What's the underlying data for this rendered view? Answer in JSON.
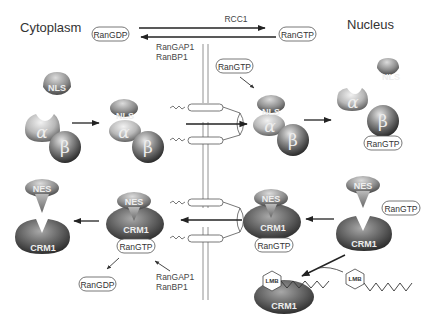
{
  "regions": {
    "cytoplasm": "Cytoplasm",
    "nucleus": "Nucleus"
  },
  "ran_cycle": {
    "ran_gdp_top": "RanGDP",
    "ran_gtp_top": "RanGTP",
    "rcc1": "RCC1",
    "rangap1_top": "RanGAP1",
    "ranbp1_top": "RanBP1"
  },
  "import_pathway": {
    "nls_cargo_left": "NLS",
    "alpha_left": "α",
    "beta_left": "β",
    "complex_nls": "NLS",
    "complex_alpha": "α",
    "complex_beta": "β",
    "ran_gtp_entering": "RanGTP",
    "pore_complex_nls": "NLS",
    "pore_complex_alpha": "α",
    "pore_complex_beta": "β",
    "nls_cargo_right": "NLS",
    "alpha_right": "α",
    "beta_right": "β",
    "ran_gtp_beta": "RanGTP"
  },
  "export_pathway": {
    "nes_free_left": "NES",
    "crm1_free_left": "CRM1",
    "complex_nes_cyto": "NES",
    "complex_crm1_cyto": "CRM1",
    "complex_rangtp_cyto": "RanGTP",
    "ran_gdp_bottom": "RanGDP",
    "rangap1_bottom": "RanGAP1",
    "ranbp1_bottom": "RanBP1",
    "complex_nes_nuc": "NES",
    "complex_crm1_nuc": "CRM1",
    "complex_rangtp_nuc": "RanGTP",
    "nes_free_right": "NES",
    "ran_gtp_free_right": "RanGTP",
    "crm1_free_right": "CRM1"
  },
  "inhibition": {
    "lmb_bound": "LMB",
    "crm1_bound": "CRM1",
    "lmb_free": "LMB"
  },
  "colors": {
    "protein_dark": "#3a3a3a",
    "protein_mid": "#8a8a8a",
    "protein_light": "#cfcfcf",
    "line": "#222222",
    "membrane": "#777777"
  }
}
